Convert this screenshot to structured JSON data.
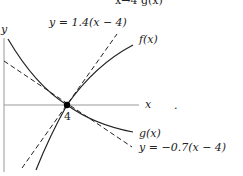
{
  "top_fragment": "x→4 g(x)",
  "axes": {
    "x_label": "x",
    "y_label": "y",
    "point_label": "4"
  },
  "curves": {
    "f": {
      "label": "f(x)"
    },
    "g": {
      "label": "g(x)"
    },
    "tangent_f": {
      "label": "y = 1.4(x − 4)",
      "slope": 1.4,
      "through_x": 4
    },
    "tangent_g": {
      "label": "y = −0.7(x − 4)",
      "slope": -0.7,
      "through_x": 4
    }
  },
  "stray_mark": "."
}
